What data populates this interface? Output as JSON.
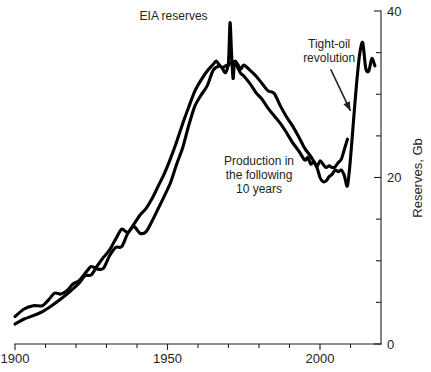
{
  "figure": {
    "background": "#ffffff",
    "ink_color": "#000000",
    "text_color": "#231f20"
  },
  "chart_data": {
    "type": "line",
    "title": "",
    "subtitle": "",
    "xlabel": "",
    "ylabel": "Reserves, Gb",
    "xlim": [
      1900,
      2020
    ],
    "ylim": [
      0,
      40
    ],
    "x_major_ticks": [
      1900,
      1950,
      2000
    ],
    "x_major_tick_labels": [
      "1900",
      "1950",
      "2000"
    ],
    "x_minor_tick_step": 10,
    "y_major_ticks": [
      0,
      20,
      40
    ],
    "y_major_tick_labels": [
      "0",
      "20",
      "40"
    ],
    "y_minor_tick_step": 5,
    "grid": false,
    "legend": "none",
    "axis_position": {
      "y_axis": "right",
      "x_axis": "bottom"
    },
    "annotations": [
      {
        "name": "eia-reserves-label",
        "text": "EIA reserves",
        "lines": [
          "EIA reserves"
        ],
        "x": 1952,
        "y": 38.9,
        "has_arrow": false
      },
      {
        "name": "production-label",
        "text": "Production in the following 10 years",
        "lines": [
          "Production in",
          "the following",
          "10 years"
        ],
        "x": 1980,
        "y": 21.5,
        "has_arrow": false
      },
      {
        "name": "tight-oil-label",
        "text": "Tight-oil revolution",
        "lines": [
          "Tight-oil",
          "revolution"
        ],
        "x": 2003,
        "y": 35.6,
        "has_arrow": true,
        "arrow_from": [
          2003.5,
          33.0
        ],
        "arrow_to": [
          2010.0,
          28.0
        ]
      }
    ],
    "series": [
      {
        "name": "EIA reserves",
        "color": "#000000",
        "points": [
          [
            1900,
            3.3
          ],
          [
            1903,
            4.2
          ],
          [
            1906,
            4.6
          ],
          [
            1909,
            4.6
          ],
          [
            1911,
            5.3
          ],
          [
            1913,
            6.1
          ],
          [
            1915,
            6.0
          ],
          [
            1917,
            6.4
          ],
          [
            1919,
            7.2
          ],
          [
            1921,
            7.6
          ],
          [
            1923,
            8.5
          ],
          [
            1925,
            9.3
          ],
          [
            1927,
            9.0
          ],
          [
            1929,
            9.1
          ],
          [
            1931,
            10.6
          ],
          [
            1933,
            11.6
          ],
          [
            1935,
            11.7
          ],
          [
            1937,
            13.3
          ],
          [
            1939,
            14.1
          ],
          [
            1941,
            13.3
          ],
          [
            1943,
            13.5
          ],
          [
            1945,
            14.8
          ],
          [
            1947,
            16.3
          ],
          [
            1949,
            17.8
          ],
          [
            1951,
            19.4
          ],
          [
            1953,
            21.6
          ],
          [
            1955,
            23.6
          ],
          [
            1957,
            26.3
          ],
          [
            1959,
            28.6
          ],
          [
            1961,
            29.9
          ],
          [
            1963,
            31.0
          ],
          [
            1965,
            32.9
          ],
          [
            1967,
            33.4
          ],
          [
            1968,
            33.1
          ],
          [
            1969,
            32.6
          ],
          [
            1970,
            33.9
          ],
          [
            1970.5,
            38.6
          ],
          [
            1971,
            34.9
          ],
          [
            1971.5,
            31.9
          ],
          [
            1972,
            33.9
          ],
          [
            1973,
            33.6
          ],
          [
            1974,
            33.0
          ],
          [
            1975,
            33.5
          ],
          [
            1977,
            32.9
          ],
          [
            1979,
            32.2
          ],
          [
            1981,
            31.3
          ],
          [
            1983,
            30.4
          ],
          [
            1985,
            30.1
          ],
          [
            1987,
            28.6
          ],
          [
            1989,
            27.3
          ],
          [
            1991,
            26.2
          ],
          [
            1993,
            24.9
          ],
          [
            1995,
            23.5
          ],
          [
            1997,
            22.5
          ],
          [
            1999,
            21.2
          ],
          [
            2000,
            20.0
          ],
          [
            2001,
            19.5
          ],
          [
            2002,
            19.6
          ],
          [
            2003,
            20.1
          ],
          [
            2004,
            20.4
          ],
          [
            2005,
            20.9
          ],
          [
            2006,
            20.7
          ],
          [
            2007,
            20.9
          ],
          [
            2008,
            20.2
          ],
          [
            2009,
            19.0
          ],
          [
            2010,
            22.3
          ],
          [
            2011,
            26.9
          ],
          [
            2012,
            31.3
          ],
          [
            2013,
            34.8
          ],
          [
            2014,
            36.2
          ],
          [
            2015,
            33.1
          ],
          [
            2016,
            32.8
          ],
          [
            2017,
            34.3
          ],
          [
            2018,
            33.4
          ]
        ]
      },
      {
        "name": "Production in the following 10 years",
        "color": "#000000",
        "points": [
          [
            1900,
            2.4
          ],
          [
            1903,
            3.0
          ],
          [
            1906,
            3.4
          ],
          [
            1909,
            3.9
          ],
          [
            1912,
            4.6
          ],
          [
            1915,
            5.4
          ],
          [
            1918,
            6.3
          ],
          [
            1921,
            7.3
          ],
          [
            1923,
            8.2
          ],
          [
            1925,
            8.3
          ],
          [
            1927,
            9.4
          ],
          [
            1929,
            10.4
          ],
          [
            1931,
            11.3
          ],
          [
            1933,
            12.6
          ],
          [
            1935,
            13.8
          ],
          [
            1937,
            13.4
          ],
          [
            1939,
            14.4
          ],
          [
            1941,
            15.5
          ],
          [
            1943,
            16.3
          ],
          [
            1945,
            17.5
          ],
          [
            1947,
            19.0
          ],
          [
            1949,
            20.5
          ],
          [
            1951,
            22.3
          ],
          [
            1953,
            24.3
          ],
          [
            1955,
            26.5
          ],
          [
            1957,
            28.5
          ],
          [
            1959,
            30.4
          ],
          [
            1961,
            31.7
          ],
          [
            1963,
            32.8
          ],
          [
            1965,
            33.6
          ],
          [
            1966,
            34.0
          ],
          [
            1967,
            33.5
          ],
          [
            1968,
            33.2
          ],
          [
            1969,
            33.4
          ],
          [
            1970,
            33.5
          ],
          [
            1971,
            33.8
          ],
          [
            1972,
            33.9
          ],
          [
            1973,
            33.2
          ],
          [
            1974,
            32.5
          ],
          [
            1975,
            32.2
          ],
          [
            1977,
            31.3
          ],
          [
            1979,
            30.2
          ],
          [
            1981,
            29.4
          ],
          [
            1983,
            28.3
          ],
          [
            1985,
            27.4
          ],
          [
            1987,
            26.5
          ],
          [
            1989,
            25.4
          ],
          [
            1991,
            24.2
          ],
          [
            1993,
            23.2
          ],
          [
            1995,
            22.1
          ],
          [
            1996,
            22.4
          ],
          [
            1997,
            21.6
          ],
          [
            1998,
            21.9
          ],
          [
            1999,
            21.3
          ],
          [
            2000,
            22.0
          ],
          [
            2001,
            21.6
          ],
          [
            2002,
            21.2
          ],
          [
            2003,
            21.4
          ],
          [
            2004,
            21.2
          ],
          [
            2005,
            21.3
          ],
          [
            2006,
            21.8
          ],
          [
            2007,
            22.2
          ],
          [
            2008,
            23.4
          ],
          [
            2009,
            24.6
          ]
        ]
      }
    ]
  }
}
